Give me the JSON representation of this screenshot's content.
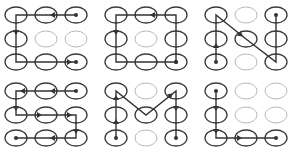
{
  "grid": {
    "cols": 3,
    "rows": 3
  },
  "colors": {
    "ring_active": "#3a3a3a",
    "ring_inactive": "#b8b8b8",
    "line": "#333333"
  },
  "panels": [
    {
      "name": "pattern-1",
      "path": [
        [
          2,
          0
        ],
        [
          1,
          0
        ],
        [
          0,
          0
        ],
        [
          0,
          1
        ],
        [
          0,
          2
        ],
        [
          1,
          2
        ],
        [
          2,
          2
        ]
      ],
      "arrows": [
        [
          2,
          0,
          1,
          0
        ],
        [
          0,
          0,
          0,
          1
        ],
        [
          1,
          2,
          2,
          2
        ]
      ],
      "inactive": [
        [
          1,
          1
        ],
        [
          2,
          1
        ]
      ]
    },
    {
      "name": "pattern-2",
      "path": [
        [
          2,
          2
        ],
        [
          2,
          1
        ],
        [
          2,
          0
        ],
        [
          1,
          0
        ],
        [
          0,
          0
        ],
        [
          0,
          1
        ],
        [
          0,
          2
        ],
        [
          1,
          2
        ],
        [
          2,
          2
        ]
      ],
      "arrows": [
        [
          2,
          0,
          1,
          0
        ],
        [
          0,
          0,
          0,
          1
        ]
      ],
      "inactive": [
        [
          1,
          1
        ]
      ]
    },
    {
      "name": "pattern-3",
      "path": [
        [
          0,
          2
        ],
        [
          0,
          1
        ],
        [
          0,
          0
        ],
        [
          1,
          1
        ],
        [
          2,
          2
        ],
        [
          2,
          1
        ],
        [
          2,
          0
        ]
      ],
      "arrows": [
        [
          0,
          2,
          0,
          1
        ],
        [
          0,
          0,
          1,
          1
        ]
      ],
      "inactive": [
        [
          1,
          0
        ],
        [
          1,
          2
        ]
      ]
    },
    {
      "name": "pattern-4",
      "path": [
        [
          2,
          0
        ],
        [
          1,
          0
        ],
        [
          0,
          0
        ],
        [
          0,
          1
        ],
        [
          1,
          1
        ],
        [
          2,
          1
        ],
        [
          2,
          2
        ],
        [
          1,
          2
        ],
        [
          0,
          2
        ]
      ],
      "arrows": [
        [
          2,
          0,
          1,
          0
        ],
        [
          1,
          0,
          0,
          0
        ],
        [
          0,
          0,
          0,
          1
        ],
        [
          0,
          1,
          1,
          1
        ],
        [
          1,
          1,
          2,
          1
        ],
        [
          2,
          1,
          2,
          2
        ],
        [
          2,
          2,
          1,
          2
        ]
      ],
      "inactive": []
    },
    {
      "name": "pattern-5",
      "path": [
        [
          0,
          2
        ],
        [
          0,
          1
        ],
        [
          0,
          0
        ],
        [
          1,
          1
        ],
        [
          2,
          0
        ],
        [
          2,
          1
        ],
        [
          2,
          2
        ]
      ],
      "arrows": [
        [
          0,
          2,
          0,
          1
        ],
        [
          0,
          1,
          0,
          0
        ],
        [
          1,
          1,
          2,
          0
        ],
        [
          2,
          0,
          2,
          1
        ]
      ],
      "inactive": [
        [
          1,
          0
        ],
        [
          1,
          2
        ]
      ]
    },
    {
      "name": "pattern-6",
      "path": [
        [
          0,
          0
        ],
        [
          0,
          1
        ],
        [
          0,
          2
        ],
        [
          1,
          2
        ],
        [
          2,
          2
        ]
      ],
      "arrows": [
        [
          0,
          0,
          0,
          1
        ],
        [
          0,
          1,
          0,
          2
        ],
        [
          0,
          2,
          1,
          2
        ]
      ],
      "inactive": [
        [
          1,
          0
        ],
        [
          2,
          0
        ],
        [
          1,
          1
        ],
        [
          2,
          1
        ]
      ]
    }
  ]
}
